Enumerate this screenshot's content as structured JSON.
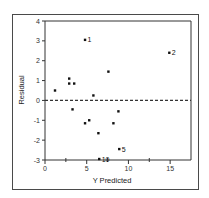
{
  "chart_data": {
    "type": "scatter",
    "title": "",
    "xlabel": "Y  Predicted",
    "ylabel": "Residual",
    "xlim": [
      0,
      17.5
    ],
    "ylim": [
      -3,
      4
    ],
    "x_ticks": [
      0,
      5,
      10,
      15
    ],
    "x_minor_ticks": [
      2.5,
      7.5,
      12.5
    ],
    "y_ticks": [
      -3,
      -2,
      -1,
      0,
      1,
      2,
      3,
      4
    ],
    "reference_line": {
      "y": 0,
      "style": "dashed"
    },
    "grid": false,
    "legend": null,
    "points": [
      {
        "x": 4.8,
        "y": 3.05,
        "label": "1"
      },
      {
        "x": 14.9,
        "y": 2.4,
        "label": "2"
      },
      {
        "x": 8.9,
        "y": -2.45,
        "label": "5"
      },
      {
        "x": 6.5,
        "y": -2.95,
        "label": "10"
      },
      {
        "x": 1.2,
        "y": 0.5,
        "label": ""
      },
      {
        "x": 2.9,
        "y": 1.1,
        "label": ""
      },
      {
        "x": 2.9,
        "y": 0.85,
        "label": ""
      },
      {
        "x": 3.5,
        "y": 0.85,
        "label": ""
      },
      {
        "x": 5.8,
        "y": 0.25,
        "label": ""
      },
      {
        "x": 7.6,
        "y": 1.45,
        "label": ""
      },
      {
        "x": 3.3,
        "y": -0.45,
        "label": ""
      },
      {
        "x": 4.8,
        "y": -1.15,
        "label": ""
      },
      {
        "x": 5.3,
        "y": -1.0,
        "label": ""
      },
      {
        "x": 6.4,
        "y": -1.65,
        "label": ""
      },
      {
        "x": 8.2,
        "y": -1.15,
        "label": ""
      },
      {
        "x": 8.8,
        "y": -0.55,
        "label": ""
      }
    ]
  },
  "colors": {
    "axis": "#333333",
    "point": "#111111",
    "frame": "#4a4a4a"
  }
}
